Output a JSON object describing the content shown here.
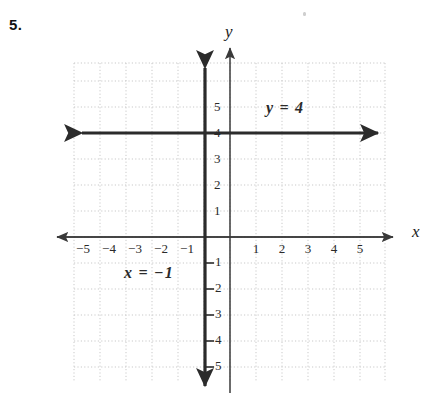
{
  "problem": {
    "number": "5."
  },
  "axes": {
    "x_label": "x",
    "y_label": "y"
  },
  "equations": {
    "horizontal": "y = 4",
    "vertical": "x = −1"
  },
  "colors": {
    "background": "#ffffff",
    "grid": "#c8c8c8",
    "axis": "#3a3a3a",
    "graph_line": "#2a2a2a",
    "text": "#1a1a1a"
  },
  "chart_data": {
    "type": "line",
    "title": "",
    "subtitle": "",
    "xlabel": "x",
    "ylabel": "y",
    "xlim": [
      -6,
      6
    ],
    "ylim": [
      -6,
      6
    ],
    "grid": true,
    "grid_style": "dotted",
    "grid_spacing": 1,
    "legend": "none",
    "x_ticks": [
      -5,
      -4,
      -3,
      -2,
      -1,
      1,
      2,
      3,
      4,
      5
    ],
    "y_ticks": [
      5,
      4,
      3,
      2,
      1,
      -1,
      -2,
      -3,
      -4,
      -5
    ],
    "x_tick_labels": [
      "−5",
      "−4",
      "−3",
      "−2",
      "−1",
      "1",
      "2",
      "3",
      "4",
      "5"
    ],
    "y_tick_labels": [
      "5",
      "4",
      "3",
      "2",
      "1",
      "1",
      "2",
      "3",
      "4",
      "5"
    ],
    "series": [
      {
        "name": "y = 4",
        "type": "horizontal-line",
        "equation": "y = 4",
        "value": 4,
        "orientation": "horizontal",
        "arrows": "both",
        "annotation": "y = 4"
      },
      {
        "name": "x = -1",
        "type": "vertical-line",
        "equation": "x = −1",
        "value": -1,
        "orientation": "vertical",
        "arrows": "both",
        "annotation": "x = −1"
      }
    ],
    "annotations": [
      {
        "text": "y = 4",
        "x": 1.4,
        "y": 4.9
      },
      {
        "text": "x = −1",
        "x": -3.6,
        "y": -1.3
      }
    ]
  },
  "x_tick_labels": [
    {
      "text": "−5",
      "left": 72,
      "top": 241
    },
    {
      "text": "−4",
      "left": 98,
      "top": 241
    },
    {
      "text": "−3",
      "left": 124,
      "top": 241
    },
    {
      "text": "−2",
      "left": 150,
      "top": 241
    },
    {
      "text": "−1",
      "left": 176,
      "top": 241
    }
  ],
  "x_tick_labels_pos": [
    {
      "text": "1",
      "left": 249,
      "top": 241
    },
    {
      "text": "2",
      "left": 275,
      "top": 241
    },
    {
      "text": "3",
      "left": 301,
      "top": 241
    },
    {
      "text": "4",
      "left": 327,
      "top": 241
    },
    {
      "text": "5",
      "left": 353,
      "top": 241
    }
  ],
  "y_tick_labels_pos": [
    {
      "text": "5",
      "left": 214,
      "top": 99
    },
    {
      "text": "4",
      "left": 214,
      "top": 125
    },
    {
      "text": "3",
      "left": 214,
      "top": 151
    },
    {
      "text": "2",
      "left": 214,
      "top": 177
    },
    {
      "text": "1",
      "left": 214,
      "top": 203
    }
  ],
  "y_tick_labels_neg": [
    {
      "text": "1",
      "left": 215,
      "top": 254
    },
    {
      "text": "2",
      "left": 215,
      "top": 280
    },
    {
      "text": "3",
      "left": 215,
      "top": 306
    },
    {
      "text": "4",
      "left": 215,
      "top": 332
    },
    {
      "text": "5",
      "left": 215,
      "top": 358
    }
  ]
}
